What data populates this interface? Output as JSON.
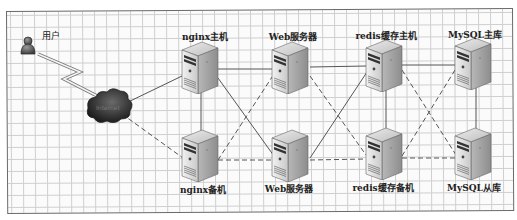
{
  "diagram": {
    "title": "",
    "user": {
      "label": "用户",
      "icon": "user-icon"
    },
    "cloud": {
      "label": "Internet",
      "icon": "cloud-icon"
    },
    "nodes": [
      {
        "id": "nginx_master",
        "label": "nginx主机",
        "row": "top",
        "icon": "server-icon"
      },
      {
        "id": "web_1",
        "label": "Web服务器",
        "row": "top",
        "icon": "server-icon"
      },
      {
        "id": "redis_master",
        "label": "redis缓存主机",
        "row": "top",
        "icon": "server-icon"
      },
      {
        "id": "mysql_master",
        "label": "MySQL主库",
        "row": "top",
        "icon": "server-icon"
      },
      {
        "id": "nginx_backup",
        "label": "nginx备机",
        "row": "bottom",
        "icon": "server-icon"
      },
      {
        "id": "web_2",
        "label": "Web服务器",
        "row": "bottom",
        "icon": "server-icon"
      },
      {
        "id": "redis_backup",
        "label": "redis缓存备机",
        "row": "bottom",
        "icon": "server-icon"
      },
      {
        "id": "mysql_slave",
        "label": "MySQL从库",
        "row": "bottom",
        "icon": "server-icon"
      }
    ],
    "edges": [
      {
        "from": "user",
        "to": "cloud",
        "style": "lightning"
      },
      {
        "from": "cloud",
        "to": "nginx_master",
        "style": "solid"
      },
      {
        "from": "cloud",
        "to": "nginx_backup",
        "style": "dashed"
      },
      {
        "from": "nginx_master",
        "to": "nginx_backup",
        "style": "solid"
      },
      {
        "from": "nginx_master",
        "to": "web_1",
        "style": "solid"
      },
      {
        "from": "nginx_master",
        "to": "web_2",
        "style": "solid"
      },
      {
        "from": "nginx_backup",
        "to": "web_1",
        "style": "dashed"
      },
      {
        "from": "nginx_backup",
        "to": "web_2",
        "style": "dashed"
      },
      {
        "from": "web_1",
        "to": "redis_master",
        "style": "solid"
      },
      {
        "from": "web_2",
        "to": "redis_master",
        "style": "solid"
      },
      {
        "from": "web_1",
        "to": "redis_backup",
        "style": "dashed"
      },
      {
        "from": "web_2",
        "to": "redis_backup",
        "style": "dashed"
      },
      {
        "from": "redis_master",
        "to": "redis_backup",
        "style": "solid"
      },
      {
        "from": "redis_master",
        "to": "mysql_master",
        "style": "solid"
      },
      {
        "from": "redis_master",
        "to": "mysql_slave",
        "style": "dashed"
      },
      {
        "from": "redis_backup",
        "to": "mysql_master",
        "style": "dashed"
      },
      {
        "from": "redis_backup",
        "to": "mysql_slave",
        "style": "dashed"
      },
      {
        "from": "mysql_master",
        "to": "mysql_slave",
        "style": "solid"
      }
    ],
    "colors": {
      "grid": "#cfcfcf",
      "frame": "#6a6a6a",
      "line": "#555555",
      "server_front": "#d8d8d8",
      "server_side": "#9a9a9a",
      "cloud": "#2a2a2a",
      "user": "#555555"
    }
  }
}
